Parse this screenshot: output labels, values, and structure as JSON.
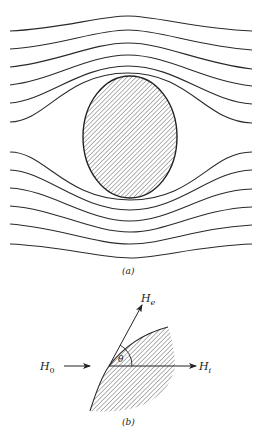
{
  "figure_a": {
    "caption": "(a)",
    "description": "Magnetic field lines around a superconducting ellipsoid (shaded), lines pushed around the body",
    "streamlines_top_count": 6,
    "streamlines_bottom_count": 6,
    "body": "hatched-ellipse"
  },
  "figure_b": {
    "caption": "(b)",
    "labels": {
      "H0": "H",
      "H0_sub": "0",
      "He": "H",
      "He_sub": "e",
      "Hi": "H",
      "Hi_sub": "i",
      "theta": "θ"
    },
    "description": "Field boundary at surface: applied field H0, external field He at angle θ, internal field Hi"
  },
  "colors": {
    "stroke": "#2a2a2a",
    "background": "#ffffff",
    "hatch": "#555555"
  }
}
